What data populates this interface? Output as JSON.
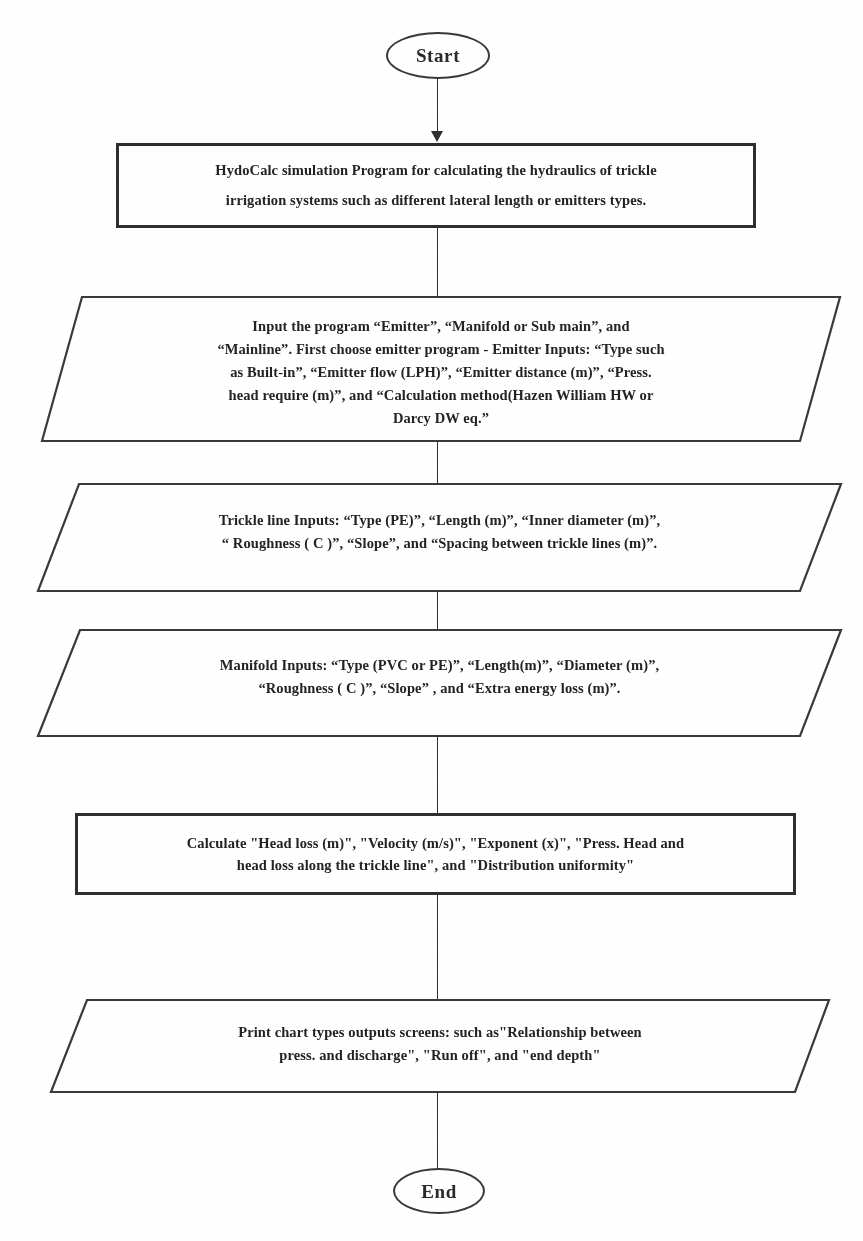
{
  "diagram": {
    "type": "flowchart",
    "stroke_color": "#2e2e2e",
    "background_color": "#ffffff"
  },
  "nodes": {
    "start": {
      "label": "Start",
      "shape": "terminator"
    },
    "intro_process": {
      "shape": "process",
      "line1": "HydoCalc simulation Program for calculating the hydraulics of trickle",
      "line2": "irrigation systems such as different lateral length or emitters types."
    },
    "emitter_input": {
      "shape": "parallelogram",
      "line1": "Input the program “Emitter”, “Manifold or Sub main”, and",
      "line2": "“Mainline”. First choose emitter program - Emitter Inputs: “Type such",
      "line3": "as Built-in”, “Emitter flow (LPH)”, “Emitter distance (m)”, “Press.",
      "line4": "head require (m)”, and “Calculation method(Hazen William HW or",
      "line5": "Darcy DW eq.”"
    },
    "trickle_line_input": {
      "shape": "parallelogram",
      "line1": "Trickle line Inputs: “Type (PE)”, “Length (m)”, “Inner diameter (m)”,",
      "line2": "“ Roughness ( C )”, “Slope”, and “Spacing between trickle lines (m)”."
    },
    "manifold_input": {
      "shape": "parallelogram",
      "line1": "Manifold Inputs: “Type (PVC or PE)”, “Length(m)”, “Diameter (m)”,",
      "line2": "“Roughness ( C )”, “Slope” , and “Extra energy loss (m)”."
    },
    "calculate_process": {
      "shape": "process",
      "line1": "Calculate \"Head loss (m)\", \"Velocity (m/s)\", \"Exponent (x)\", \"Press. Head and",
      "line2": "head loss along the trickle line\", and \"Distribution uniformity\""
    },
    "print_output": {
      "shape": "parallelogram",
      "line1": "Print chart types outputs screens: such as\"Relationship between",
      "line2": "press. and discharge\", \"Run off\", and \"end depth\""
    },
    "end": {
      "label": "End",
      "shape": "terminator"
    }
  },
  "edges": [
    {
      "from": "start",
      "to": "intro_process",
      "arrow": true
    },
    {
      "from": "intro_process",
      "to": "emitter_input",
      "arrow": false
    },
    {
      "from": "emitter_input",
      "to": "trickle_line_input",
      "arrow": false
    },
    {
      "from": "trickle_line_input",
      "to": "manifold_input",
      "arrow": false
    },
    {
      "from": "manifold_input",
      "to": "calculate_process",
      "arrow": false
    },
    {
      "from": "calculate_process",
      "to": "print_output",
      "arrow": false
    },
    {
      "from": "print_output",
      "to": "end",
      "arrow": false
    }
  ]
}
